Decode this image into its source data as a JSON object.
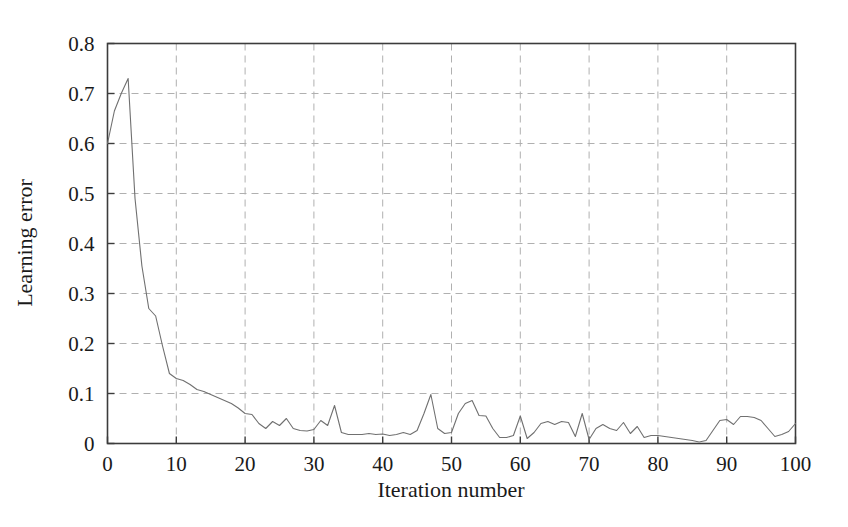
{
  "chart_data": {
    "type": "line",
    "title": "",
    "xlabel": "Iteration number",
    "ylabel": "Learning error",
    "xlim": [
      0,
      100
    ],
    "ylim": [
      0,
      0.8
    ],
    "xticks": [
      0,
      10,
      20,
      30,
      40,
      50,
      60,
      70,
      80,
      90,
      100
    ],
    "xtick_labels": [
      "0",
      "10",
      "20",
      "30",
      "40",
      "50",
      "60",
      "70",
      "80",
      "90",
      "100"
    ],
    "yticks": [
      0,
      0.1,
      0.2,
      0.3,
      0.4,
      0.5,
      0.6,
      0.7,
      0.8
    ],
    "ytick_labels": [
      "0",
      "0.1",
      "0.2",
      "0.3",
      "0.4",
      "0.5",
      "0.6",
      "0.7",
      "0.8"
    ],
    "grid": true,
    "grid_style": "dashed",
    "grid_color": "#b0b0b0",
    "legend": null,
    "legend_position": "none",
    "line_color": "#707070",
    "line_width": 1.1,
    "axis_color": "#3c3c3c",
    "background_color": "#ffffff",
    "series": [
      {
        "name": "Learning error",
        "x": [
          0,
          1,
          2,
          3,
          4,
          5,
          6,
          7,
          8,
          9,
          10,
          11,
          12,
          13,
          14,
          15,
          16,
          17,
          18,
          19,
          20,
          21,
          22,
          23,
          24,
          25,
          26,
          27,
          28,
          29,
          30,
          31,
          32,
          33,
          34,
          35,
          36,
          37,
          38,
          39,
          40,
          41,
          42,
          43,
          44,
          45,
          46,
          47,
          48,
          49,
          50,
          51,
          52,
          53,
          54,
          55,
          56,
          57,
          58,
          59,
          60,
          61,
          62,
          63,
          64,
          65,
          66,
          67,
          68,
          69,
          70,
          71,
          72,
          73,
          74,
          75,
          76,
          77,
          78,
          79,
          80,
          81,
          82,
          83,
          84,
          85,
          86,
          87,
          88,
          89,
          90,
          91,
          92,
          93,
          94,
          95,
          96,
          97,
          98,
          99,
          100
        ],
        "y": [
          0.6,
          0.665,
          0.7,
          0.73,
          0.49,
          0.355,
          0.27,
          0.255,
          0.195,
          0.14,
          0.13,
          0.126,
          0.118,
          0.108,
          0.104,
          0.098,
          0.092,
          0.086,
          0.08,
          0.071,
          0.06,
          0.058,
          0.04,
          0.03,
          0.044,
          0.036,
          0.05,
          0.03,
          0.026,
          0.025,
          0.028,
          0.046,
          0.036,
          0.076,
          0.022,
          0.018,
          0.018,
          0.018,
          0.02,
          0.018,
          0.019,
          0.016,
          0.018,
          0.022,
          0.018,
          0.026,
          0.06,
          0.098,
          0.03,
          0.02,
          0.022,
          0.06,
          0.08,
          0.086,
          0.056,
          0.055,
          0.03,
          0.012,
          0.012,
          0.016,
          0.055,
          0.01,
          0.022,
          0.04,
          0.044,
          0.038,
          0.044,
          0.042,
          0.014,
          0.06,
          0.008,
          0.03,
          0.038,
          0.03,
          0.026,
          0.042,
          0.02,
          0.034,
          0.012,
          0.016,
          0.016,
          0.014,
          0.012,
          0.01,
          0.008,
          0.006,
          0.003,
          0.006,
          0.026,
          0.046,
          0.048,
          0.038,
          0.054,
          0.054,
          0.052,
          0.046,
          0.03,
          0.014,
          0.018,
          0.024,
          0.04
        ]
      }
    ]
  },
  "figure": {
    "alt": "Line chart of learning error versus iteration number"
  }
}
